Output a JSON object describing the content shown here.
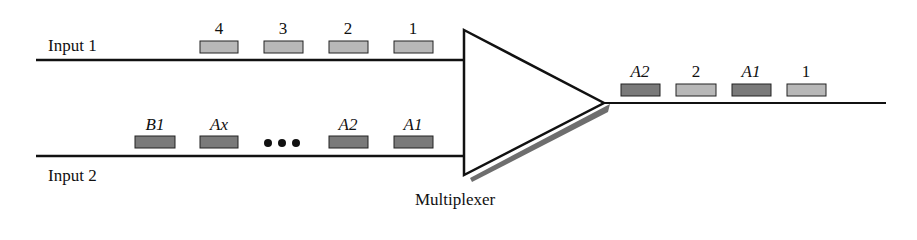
{
  "diagram": {
    "title": "Multiplexer",
    "inputs": [
      {
        "label": "Input 1",
        "packets": [
          "4",
          "3",
          "2",
          "1"
        ],
        "packet_color": "#b8b8b8"
      },
      {
        "label": "Input 2",
        "packets": [
          "B1",
          "Ax",
          "...",
          "A2",
          "A1"
        ],
        "packet_color": "#7a7a7a"
      }
    ],
    "output": {
      "packets": [
        "A2",
        "2",
        "A1",
        "1"
      ]
    },
    "ellipsis": "•••",
    "colors": {
      "light_packet": "#b8b8b8",
      "dark_packet": "#7a7a7a",
      "line": "#111111",
      "shadow": "#6e6e6e"
    }
  }
}
